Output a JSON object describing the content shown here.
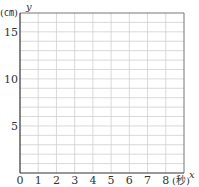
{
  "chart_data": {
    "type": "line",
    "title": "",
    "xlabel": "x",
    "ylabel": "y",
    "x_unit": "(秒)",
    "y_unit": "(㎝)",
    "xlim": [
      0,
      9
    ],
    "ylim": [
      0,
      17
    ],
    "x_ticks": [
      0,
      1,
      2,
      3,
      4,
      5,
      6,
      7,
      8
    ],
    "x_tick_labels": [
      "0",
      "1",
      "2",
      "3",
      "4",
      "5",
      "6",
      "7",
      "8"
    ],
    "y_ticks": [
      5,
      10,
      15
    ],
    "y_tick_labels": [
      "5",
      "10",
      "15"
    ],
    "grid": true,
    "grid_x_step": 1,
    "grid_y_step": 1,
    "series": []
  }
}
